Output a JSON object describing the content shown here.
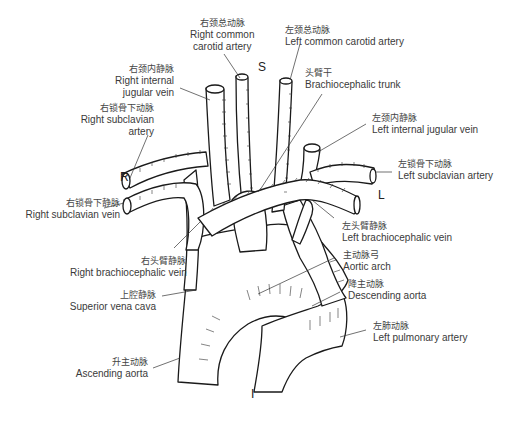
{
  "orientation": {
    "superior": "S",
    "inferior": "I",
    "right": "R",
    "left": "L"
  },
  "labels": [
    {
      "id": "right-common-carotid-artery",
      "zh": "右颈总动脉",
      "en": [
        "Right common",
        "carotid artery"
      ]
    },
    {
      "id": "left-common-carotid-artery",
      "zh": "左颈总动脉",
      "en": [
        "Left common carotid artery"
      ]
    },
    {
      "id": "right-internal-jugular-vein",
      "zh": "右颈内静脉",
      "en": [
        "Right internal",
        "jugular vein"
      ]
    },
    {
      "id": "brachiocephalic-trunk",
      "zh": "头臂干",
      "en": [
        "Brachiocephalic trunk"
      ]
    },
    {
      "id": "right-subclavian-artery",
      "zh": "右锁骨下动脉",
      "en": [
        "Right subclavian",
        "artery"
      ]
    },
    {
      "id": "left-internal-jugular-vein",
      "zh": "左颈内静脉",
      "en": [
        "Left internal jugular vein"
      ]
    },
    {
      "id": "left-subclavian-artery",
      "zh": "左锁骨下动脉",
      "en": [
        "Left subclavian artery"
      ]
    },
    {
      "id": "right-subclavian-vein",
      "zh": "右锁骨下静脉",
      "en": [
        "Right subclavian vein"
      ]
    },
    {
      "id": "left-brachiocephalic-vein",
      "zh": "左头臂静脉",
      "en": [
        "Left brachiocephalic vein"
      ]
    },
    {
      "id": "right-brachiocephalic-vein",
      "zh": "右头臂静脉",
      "en": [
        "Right brachiocephalic vein"
      ]
    },
    {
      "id": "aortic-arch",
      "zh": "主动脉弓",
      "en": [
        "Aortic arch"
      ]
    },
    {
      "id": "superior-vena-cava",
      "zh": "上腔静脉",
      "en": [
        "Superior vena cava"
      ]
    },
    {
      "id": "descending-aorta",
      "zh": "降主动脉",
      "en": [
        "Descending aorta"
      ]
    },
    {
      "id": "left-pulmonary-artery",
      "zh": "左肺动脉",
      "en": [
        "Left pulmonary artery"
      ]
    },
    {
      "id": "ascending-aorta",
      "zh": "升主动脉",
      "en": [
        "Ascending aorta"
      ]
    }
  ],
  "colors": {
    "background": "#ffffff",
    "ink": "#1a1a1a",
    "text": "#3a3a3a"
  }
}
